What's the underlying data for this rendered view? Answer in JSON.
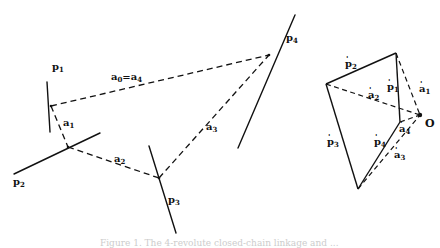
{
  "figure": {
    "left_diagram": {
      "lines": [
        {
          "name": "p1",
          "label": "p",
          "sub": "1"
        },
        {
          "name": "p2",
          "label": "p",
          "sub": "2"
        },
        {
          "name": "p3",
          "label": "p",
          "sub": "3"
        },
        {
          "name": "p4",
          "label": "p",
          "sub": "4"
        }
      ],
      "links": [
        {
          "name": "a0=a4",
          "label": "a",
          "sub": "0",
          "eq": "=",
          "label2": "a",
          "sub2": "4"
        },
        {
          "name": "a1",
          "label": "a",
          "sub": "1"
        },
        {
          "name": "a2",
          "label": "a",
          "sub": "2"
        },
        {
          "name": "a3",
          "label": "a",
          "sub": "3"
        }
      ]
    },
    "right_diagram": {
      "sides": [
        {
          "name": "p1'",
          "label": "p",
          "sub": "1"
        },
        {
          "name": "p2'",
          "label": "p",
          "sub": "2"
        },
        {
          "name": "p3'",
          "label": "p",
          "sub": "3"
        },
        {
          "name": "p4'",
          "label": "p",
          "sub": "4"
        }
      ],
      "vectors": [
        {
          "name": "a1'",
          "label": "a",
          "sub": "1"
        },
        {
          "name": "a2'",
          "label": "a",
          "sub": "2"
        },
        {
          "name": "a3'",
          "label": "a",
          "sub": "3"
        },
        {
          "name": "a4'",
          "label": "a",
          "sub": "4"
        }
      ],
      "origin_label": "O"
    },
    "caption": "Figure 1. The 4-revolute closed-chain linkage and ..."
  }
}
